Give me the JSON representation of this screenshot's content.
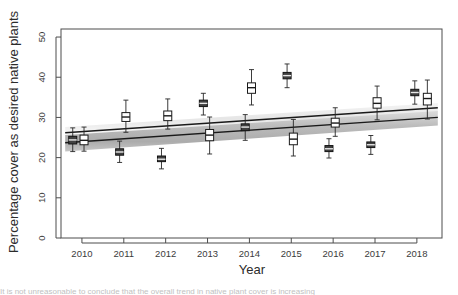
{
  "figure": {
    "background": "#ffffff",
    "plot_border_color": "#4d4d4d",
    "caption_fragment": "It is not unreasonable to conclude that the overall trend in native plant cover is increasing"
  },
  "chart_data": {
    "type": "boxplot",
    "title": "",
    "xlabel": "Year",
    "ylabel": "Percentage cover as desired native plants",
    "x": [
      2010,
      2011,
      2012,
      2013,
      2014,
      2015,
      2016,
      2017,
      2018
    ],
    "xtick_labels": [
      "2010",
      "2011",
      "2012",
      "2013",
      "2014",
      "2015",
      "2016",
      "2017",
      "2018"
    ],
    "ytick_labels": [
      "0",
      "10",
      "20",
      "30",
      "40",
      "50"
    ],
    "ytick_values": [
      0,
      10,
      20,
      30,
      40,
      50
    ],
    "xlim": [
      2009.5,
      2018.6
    ],
    "ylim": [
      0,
      52
    ],
    "grid": false,
    "legend": null,
    "series": [
      {
        "name": "Group A (open boxes)",
        "box_fill": "#ffffff",
        "box_stroke": "#1a1a1a",
        "boxes": [
          {
            "x": 2010.05,
            "lower_whisker": 21.6,
            "q1": 23.2,
            "median": 24.3,
            "q3": 25.6,
            "upper_whisker": 27.6
          },
          {
            "x": 2011.05,
            "lower_whisker": 26.3,
            "q1": 29.0,
            "median": 30.1,
            "q3": 31.2,
            "upper_whisker": 34.3
          },
          {
            "x": 2012.05,
            "lower_whisker": 27.1,
            "q1": 29.2,
            "median": 30.4,
            "q3": 31.6,
            "upper_whisker": 34.6
          },
          {
            "x": 2013.05,
            "lower_whisker": 20.9,
            "q1": 24.2,
            "median": 25.6,
            "q3": 27.0,
            "upper_whisker": 30.1
          },
          {
            "x": 2014.05,
            "lower_whisker": 33.1,
            "q1": 36.0,
            "median": 37.4,
            "q3": 38.6,
            "upper_whisker": 41.9
          },
          {
            "x": 2015.05,
            "lower_whisker": 20.4,
            "q1": 23.2,
            "median": 24.6,
            "q3": 26.1,
            "upper_whisker": 29.5
          },
          {
            "x": 2016.05,
            "lower_whisker": 25.3,
            "q1": 27.6,
            "median": 28.6,
            "q3": 29.8,
            "upper_whisker": 32.4
          },
          {
            "x": 2017.05,
            "lower_whisker": 29.4,
            "q1": 32.3,
            "median": 33.5,
            "q3": 34.9,
            "upper_whisker": 37.8
          },
          {
            "x": 2018.25,
            "lower_whisker": 29.6,
            "q1": 33.1,
            "median": 34.7,
            "q3": 36.0,
            "upper_whisker": 39.3
          }
        ]
      },
      {
        "name": "Group B (filled boxes)",
        "box_fill": "#404040",
        "box_stroke": "#141414",
        "boxes": [
          {
            "x": 2009.78,
            "lower_whisker": 21.5,
            "q1": 23.4,
            "median": 24.4,
            "q3": 25.3,
            "upper_whisker": 27.4
          },
          {
            "x": 2010.9,
            "lower_whisker": 18.8,
            "q1": 20.6,
            "median": 21.4,
            "q3": 22.2,
            "upper_whisker": 24.1
          },
          {
            "x": 2011.9,
            "lower_whisker": 17.2,
            "q1": 19.0,
            "median": 19.6,
            "q3": 20.4,
            "upper_whisker": 22.3
          },
          {
            "x": 2012.9,
            "lower_whisker": 30.6,
            "q1": 32.7,
            "median": 33.5,
            "q3": 34.3,
            "upper_whisker": 36.0
          },
          {
            "x": 2013.9,
            "lower_whisker": 24.3,
            "q1": 26.7,
            "median": 27.6,
            "q3": 28.4,
            "upper_whisker": 30.7
          },
          {
            "x": 2014.9,
            "lower_whisker": 37.4,
            "q1": 39.6,
            "median": 40.4,
            "q3": 41.2,
            "upper_whisker": 43.3
          },
          {
            "x": 2015.9,
            "lower_whisker": 19.9,
            "q1": 21.5,
            "median": 22.2,
            "q3": 23.0,
            "upper_whisker": 24.7
          },
          {
            "x": 2016.9,
            "lower_whisker": 20.8,
            "q1": 22.5,
            "median": 23.2,
            "q3": 23.9,
            "upper_whisker": 25.5
          },
          {
            "x": 2017.95,
            "lower_whisker": 33.3,
            "q1": 35.4,
            "median": 36.2,
            "q3": 37.0,
            "upper_whisker": 39.1
          }
        ]
      }
    ],
    "trend_lines": [
      {
        "name": "upper-trend-line",
        "color": "#1a1a1a",
        "x_start": 2009.6,
        "y_start": 26.2,
        "x_end": 2018.5,
        "y_end": 32.4
      },
      {
        "name": "lower-trend-line",
        "color": "#1a1a1a",
        "x_start": 2009.6,
        "y_start": 23.7,
        "x_end": 2018.5,
        "y_end": 30.0
      }
    ],
    "confidence_bands": [
      {
        "name": "upper-band",
        "fill": "#ebebeb",
        "x_start": 2009.6,
        "x_end": 2018.5,
        "y_start_low": 25.0,
        "y_start_high": 27.6,
        "y_end_low": 31.3,
        "y_end_high": 33.6
      },
      {
        "name": "lower-band",
        "fill": "#b8b8b8",
        "x_start": 2009.6,
        "x_end": 2018.5,
        "y_start_low": 21.5,
        "y_start_high": 25.6,
        "y_end_low": 28.0,
        "y_end_high": 31.6
      }
    ]
  }
}
